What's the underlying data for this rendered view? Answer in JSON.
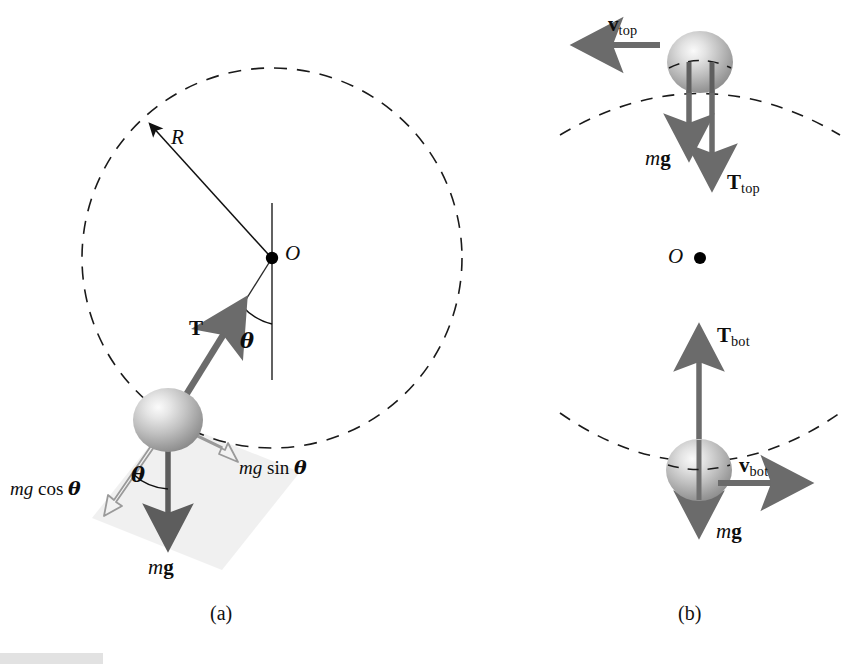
{
  "figure": {
    "background_color": "#ffffff",
    "ink_color": "#0d0d0d",
    "vector_color": "#6b6b6b",
    "vector_dark_color": "#5a5a5a",
    "hollow_vector_stroke": "#9a9a9a",
    "hollow_vector_fill": "#f2f2f2",
    "shade_color": "#efefef",
    "dash_color": "#1a1a1a",
    "sphere_light": "#f3f3f3",
    "sphere_mid": "#b8b8b8",
    "sphere_dark": "#7e7e7e"
  },
  "captions": {
    "panel_a": "(a)",
    "panel_b": "(b)"
  },
  "panel_a": {
    "name": "panel-a",
    "circle": {
      "center_label": "O",
      "center_x": 272,
      "center_y": 258,
      "radius": 190,
      "style": "dashed"
    },
    "radius_label": "R",
    "tension_label": "T",
    "angle_at_pivot_label": "θ",
    "angle_at_ball_label": "θ",
    "weight_label_m": "m",
    "weight_label_g": "g",
    "component_tangential": {
      "prefix": "mg",
      "func": "sin",
      "arg": "θ",
      "full": "mg sin θ"
    },
    "component_radial": {
      "prefix": "mg",
      "func": "cos",
      "arg": "θ",
      "full": "mg cos θ"
    }
  },
  "panel_b": {
    "name": "panel-b",
    "center_label": "O",
    "top": {
      "velocity_symbol": "v",
      "velocity_sub": "top",
      "tension_symbol": "T",
      "tension_sub": "top",
      "weight_m": "m",
      "weight_g": "g",
      "velocity_direction": "left",
      "tension_direction": "down",
      "weight_direction": "down"
    },
    "bottom": {
      "velocity_symbol": "v",
      "velocity_sub": "bot",
      "tension_symbol": "T",
      "tension_sub": "bot",
      "weight_m": "m",
      "weight_g": "g",
      "velocity_direction": "right",
      "tension_direction": "up",
      "weight_direction": "down"
    }
  }
}
